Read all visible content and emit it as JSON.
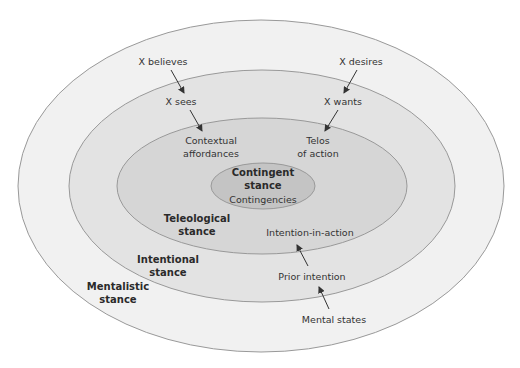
{
  "diagram": {
    "type": "nested-ellipses",
    "layers": [
      {
        "name": "Mentalistic stance",
        "fill": "#f1f1f1"
      },
      {
        "name": "Intentional stance",
        "fill": "#e3e3e3"
      },
      {
        "name": "Teleological stance",
        "fill": "#d6d6d6"
      },
      {
        "name": "Contingent stance",
        "fill": "#c4c4c4"
      }
    ],
    "stroke": "#999999"
  },
  "labels": {
    "x_believes": "X believes",
    "x_desires": "X desires",
    "x_sees": "X sees",
    "x_wants": "X wants",
    "contextual_1": "Contextual",
    "contextual_2": "affordances",
    "telos_1": "Telos",
    "telos_2": "of action",
    "contingent_1": "Contingent",
    "contingent_2": "stance",
    "contingencies": "Contingencies",
    "teleological_1": "Teleological",
    "teleological_2": "stance",
    "intention_in_action": "Intention-in-action",
    "intentional_1": "Intentional",
    "intentional_2": "stance",
    "prior_intention": "Prior intention",
    "mentalistic_1": "Mentalistic",
    "mentalistic_2": "stance",
    "mental_states": "Mental states"
  }
}
